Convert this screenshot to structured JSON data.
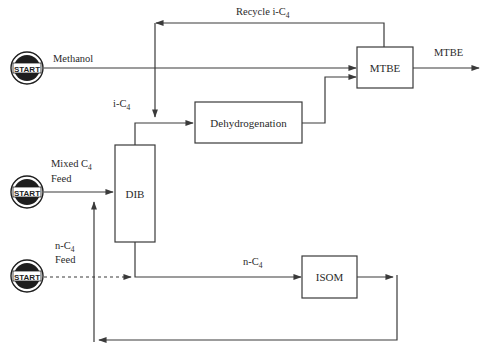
{
  "diagram": {
    "type": "process-flow",
    "colors": {
      "line": "#3a3a3a",
      "text": "#2a2a2a",
      "start_badge": "#1e1e1e",
      "background": "#ffffff"
    },
    "start_icons": [
      {
        "label": "START",
        "feeds": "Methanol"
      },
      {
        "label": "START",
        "feeds": "Mixed C4 Feed"
      },
      {
        "label": "START",
        "feeds": "n-C4 Feed"
      }
    ],
    "units": {
      "mtbe": "MTBE",
      "dehydrogenation": "Dehydrogenation",
      "dib": "DIB",
      "isom": "ISOM"
    },
    "streams": {
      "methanol": "Methanol",
      "recycle_prefix": "Recycle i-C",
      "recycle_sub": "4",
      "ic4_prefix": "i-C",
      "ic4_sub": "4",
      "mixed_line1_prefix": "Mixed C",
      "mixed_line1_sub": "4",
      "mixed_line2": "Feed",
      "nfeed_line1_prefix": "n-C",
      "nfeed_line1_sub": "4",
      "nfeed_line2": "Feed",
      "nc4_prefix": "n-C",
      "nc4_sub": "4",
      "product": "MTBE"
    }
  }
}
